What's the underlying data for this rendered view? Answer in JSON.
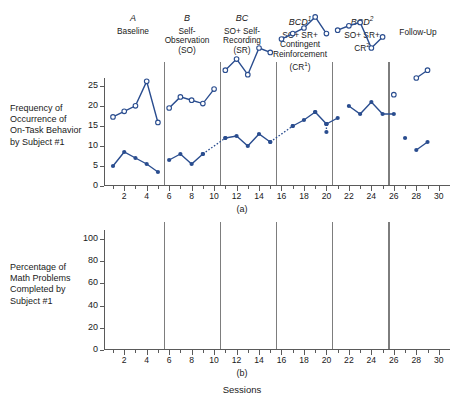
{
  "figure": {
    "x_axis_caption": "Sessions",
    "panel_a_caption": "(a)",
    "panel_b_caption": "(b)",
    "series_color": "#2a4d8f",
    "marker_color": "#2a4d8f",
    "axis_color": "#5a5a5a",
    "divider_color": "#7d7d7d"
  },
  "phases": [
    {
      "code": "A",
      "code_sup": "",
      "name_lines": [
        "Baseline"
      ]
    },
    {
      "code": "B",
      "code_sup": "",
      "name_lines": [
        "Self-",
        "Observation",
        "(SO)"
      ]
    },
    {
      "code": "BC",
      "code_sup": "",
      "name_lines": [
        "SO+ Self-",
        "Recording",
        "(SR)"
      ]
    },
    {
      "code": "BCD",
      "code_sup": "1",
      "name_lines": [
        "SO+ SR+",
        "Contingent",
        "Reinforcement",
        "(CR¹)"
      ]
    },
    {
      "code": "BCD",
      "code_sup": "2",
      "name_lines": [
        "SO+ SR+",
        "CR²"
      ]
    },
    {
      "code": "",
      "code_sup": "",
      "name_lines": [
        "Follow-Up"
      ]
    }
  ],
  "chart_data": [
    {
      "type": "line",
      "panel": "(a)",
      "title": "",
      "ylabel": "Frequency of Occurrence of On-Task Behavior by Subject #1",
      "xlabel": "Sessions",
      "ylim": [
        0,
        27
      ],
      "xlim": [
        0.2,
        31
      ],
      "yticks": [
        0,
        5,
        10,
        15,
        20,
        25
      ],
      "xticks": [
        2,
        4,
        6,
        8,
        10,
        12,
        14,
        16,
        18,
        20,
        22,
        24,
        26,
        28,
        30
      ],
      "minor_xtick_step": 1,
      "grid": false,
      "legend": "none",
      "marker": "filled-circle",
      "phase_dividers": [
        5.5,
        10.5,
        15.5,
        20.5,
        25.5
      ],
      "segments": [
        {
          "phase": "A",
          "style": "solid",
          "x": [
            1,
            2,
            3,
            4,
            5
          ],
          "y": [
            5,
            8.5,
            7,
            5.5,
            3.5
          ]
        },
        {
          "phase": "B",
          "style": "solid",
          "x": [
            6,
            7,
            8,
            9
          ],
          "y": [
            6.5,
            8,
            5.5,
            8
          ]
        },
        {
          "phase": "B-BC",
          "style": "dotted",
          "x": [
            9,
            11
          ],
          "y": [
            8,
            12
          ]
        },
        {
          "phase": "BC",
          "style": "solid",
          "x": [
            11,
            12,
            13,
            14,
            15
          ],
          "y": [
            12,
            12.5,
            10,
            13,
            11
          ]
        },
        {
          "phase": "BC-BCD1",
          "style": "dotted",
          "x": [
            15,
            17
          ],
          "y": [
            11,
            15
          ]
        },
        {
          "phase": "BCD1",
          "style": "solid",
          "x": [
            17,
            18,
            19
          ],
          "y": [
            15,
            16.5,
            18.5
          ]
        },
        {
          "phase": "BCD1b",
          "style": "solid",
          "x": [
            19,
            20
          ],
          "y": [
            18.5,
            15.5
          ]
        },
        {
          "phase": "BCD1-drop",
          "style": "dotted",
          "x": [
            20,
            20
          ],
          "y": [
            15.5,
            13.5
          ]
        },
        {
          "phase": "BCD1c",
          "style": "solid",
          "x": [
            20,
            21
          ],
          "y": [
            15.5,
            17
          ]
        },
        {
          "phase": "BCD2",
          "style": "solid",
          "x": [
            22,
            23,
            24,
            25,
            26
          ],
          "y": [
            20,
            18,
            21,
            18,
            18
          ]
        },
        {
          "phase": "FU-1",
          "style": "none",
          "x": [
            27
          ],
          "y": [
            12
          ]
        },
        {
          "phase": "FU-2",
          "style": "solid",
          "x": [
            28,
            29
          ],
          "y": [
            9,
            11
          ]
        }
      ]
    },
    {
      "type": "line",
      "panel": "(b)",
      "title": "",
      "ylabel": "Percentage of Math Problems Completed by Subject #1",
      "xlabel": "Sessions",
      "ylim": [
        0,
        108
      ],
      "xlim": [
        0.2,
        31
      ],
      "yticks": [
        0,
        20,
        40,
        60,
        80,
        100
      ],
      "xticks": [
        2,
        4,
        6,
        8,
        10,
        12,
        14,
        16,
        18,
        20,
        22,
        24,
        26,
        28,
        30
      ],
      "minor_xtick_step": 1,
      "grid": false,
      "legend": "none",
      "marker": "open-circle",
      "phase_dividers": [
        5.5,
        10.5,
        15.5,
        20.5,
        25.5
      ],
      "segments": [
        {
          "phase": "A",
          "style": "solid",
          "x": [
            1,
            2,
            3,
            4,
            5
          ],
          "y": [
            10,
            15,
            20,
            42,
            5
          ]
        },
        {
          "phase": "B",
          "style": "solid",
          "x": [
            6,
            7,
            8,
            9,
            10
          ],
          "y": [
            18,
            28,
            25,
            22,
            35
          ]
        },
        {
          "phase": "BC",
          "style": "solid",
          "x": [
            11,
            12,
            13,
            14,
            15
          ],
          "y": [
            52,
            62,
            48,
            72,
            68
          ]
        },
        {
          "phase": "BCD1",
          "style": "solid",
          "x": [
            16,
            17,
            18,
            19,
            20
          ],
          "y": [
            80,
            85,
            90,
            100,
            85
          ]
        },
        {
          "phase": "BCD2",
          "style": "solid",
          "x": [
            21,
            22,
            23,
            24,
            25
          ],
          "y": [
            88,
            92,
            95,
            72,
            82
          ]
        },
        {
          "phase": "FU-1",
          "style": "none",
          "x": [
            26
          ],
          "y": [
            30
          ]
        },
        {
          "phase": "FU-2",
          "style": "solid",
          "x": [
            28,
            29
          ],
          "y": [
            45,
            52
          ]
        }
      ]
    }
  ]
}
